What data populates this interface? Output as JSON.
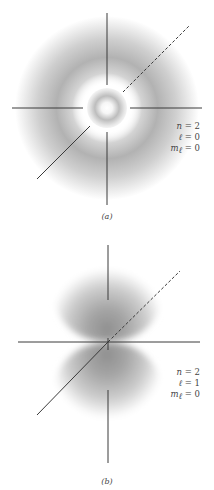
{
  "figure": {
    "panels": [
      {
        "id": "a",
        "caption": "(a)",
        "orbital": "2s",
        "quantum_numbers": {
          "n": "n = 2",
          "l": "ℓ = 0",
          "ml": "m",
          "ml_sub": "ℓ",
          "ml_val": " = 0"
        }
      },
      {
        "id": "b",
        "caption": "(b)",
        "orbital": "2p (m=0)",
        "quantum_numbers": {
          "n": "n = 2",
          "l": "ℓ = 1",
          "ml": "m",
          "ml_sub": "ℓ",
          "ml_val": " = 0"
        }
      }
    ],
    "colors": {
      "background": "#ffffff",
      "axis": "#3a3a3a",
      "cloud_dark": "#8a8a8a",
      "label": "#444444"
    }
  }
}
